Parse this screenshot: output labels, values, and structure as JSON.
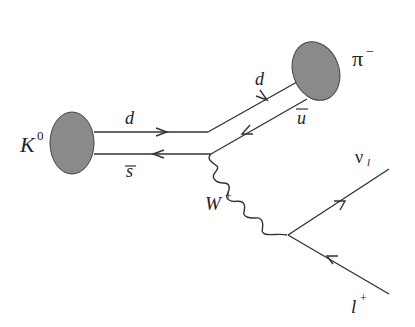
{
  "diagram": {
    "type": "feynman",
    "colors": {
      "line": "#333333",
      "blob": "#8a8a8a",
      "blob_stroke": "#444444",
      "text": "#222222"
    },
    "particles": {
      "initial": {
        "symbol": "K",
        "superscript": "0"
      },
      "final_meson": {
        "symbol": "π",
        "superscript": "−"
      },
      "boson": {
        "symbol": "W",
        "superscript": "+"
      },
      "neutrino": {
        "symbol": "ν",
        "subscript": "l"
      },
      "lepton": {
        "symbol": "l",
        "superscript": "+"
      }
    },
    "quarks": {
      "upper_left": "d",
      "lower_left": "s",
      "upper_right": "d",
      "lower_right": "u"
    }
  }
}
